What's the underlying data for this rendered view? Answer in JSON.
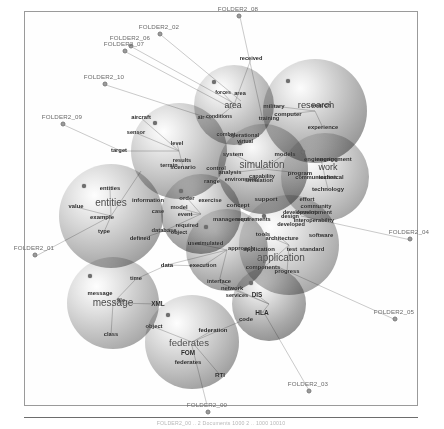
{
  "figure": {
    "caption": "FOLDER2_00  .. 2   Documents   1000 2   ..  1000    10010",
    "frame_color": "#9a9a9a",
    "background": "#ffffff"
  },
  "chart_data": {
    "type": "scatter",
    "xlabel": "",
    "ylabel": "",
    "legend": "none",
    "grid": false,
    "clusters": [
      {
        "id": "research",
        "label": "research",
        "cx": 314,
        "cy": 110,
        "r": 52,
        "shade": "gB"
      },
      {
        "id": "area",
        "label": "area",
        "cx": 233,
        "cy": 104,
        "r": 40,
        "shade": "gA"
      },
      {
        "id": "simulation",
        "label": "simulation",
        "cx": 262,
        "cy": 168,
        "r": 45,
        "shade": "gD"
      },
      {
        "id": "work",
        "label": "work",
        "cx": 324,
        "cy": 176,
        "r": 44,
        "shade": "gC"
      },
      {
        "id": "scenario",
        "label": "scenario",
        "cx": 178,
        "cy": 150,
        "r": 48,
        "shade": "gA"
      },
      {
        "id": "order",
        "label": "order",
        "cx": 200,
        "cy": 213,
        "r": 40,
        "shade": "gD"
      },
      {
        "id": "application",
        "label": "application",
        "cx": 288,
        "cy": 244,
        "r": 50,
        "shade": "gC"
      },
      {
        "id": "entities",
        "label": "entities",
        "cx": 110,
        "cy": 215,
        "r": 52,
        "shade": "gA"
      },
      {
        "id": "user",
        "label": "user",
        "cx": 226,
        "cy": 249,
        "r": 41,
        "shade": "gB"
      },
      {
        "id": "message",
        "label": "message",
        "cx": 112,
        "cy": 302,
        "r": 46,
        "shade": "gC"
      },
      {
        "id": "federates",
        "label": "federates",
        "cx": 191,
        "cy": 341,
        "r": 47,
        "shade": "gA"
      },
      {
        "id": "hla",
        "label": "HLA",
        "cx": 268,
        "cy": 303,
        "r": 37,
        "shade": "gD"
      }
    ],
    "terms": [
      {
        "text": "received",
        "x": 250,
        "y": 58,
        "size": 5.6
      },
      {
        "text": "forces",
        "x": 222,
        "y": 92,
        "size": 5.2
      },
      {
        "text": "area",
        "x": 239,
        "y": 93,
        "size": 5.6
      },
      {
        "text": "area",
        "x": 232,
        "y": 104,
        "size": 8.6,
        "style": "big"
      },
      {
        "text": "military",
        "x": 273,
        "y": 105,
        "size": 6.0
      },
      {
        "text": "research",
        "x": 315,
        "y": 104,
        "size": 9.4,
        "style": "big"
      },
      {
        "text": "search",
        "x": 320,
        "y": 104,
        "size": 6.2
      },
      {
        "text": "computer",
        "x": 287,
        "y": 113,
        "size": 6.0
      },
      {
        "text": "conditions",
        "x": 218,
        "y": 116,
        "size": 5.2
      },
      {
        "text": "training",
        "x": 268,
        "y": 118,
        "size": 5.6
      },
      {
        "text": "air",
        "x": 200,
        "y": 117,
        "size": 5.6
      },
      {
        "text": "aircraft",
        "x": 140,
        "y": 117,
        "size": 5.8
      },
      {
        "text": "experience",
        "x": 322,
        "y": 127,
        "size": 5.8
      },
      {
        "text": "combat",
        "x": 225,
        "y": 134,
        "size": 5.4
      },
      {
        "text": "operational",
        "x": 243,
        "y": 135,
        "size": 5.6
      },
      {
        "text": "sensor",
        "x": 135,
        "y": 132,
        "size": 5.6
      },
      {
        "text": "virtual",
        "x": 244,
        "y": 141,
        "size": 5.4
      },
      {
        "text": "level",
        "x": 176,
        "y": 143,
        "size": 5.6
      },
      {
        "text": "target",
        "x": 118,
        "y": 150,
        "size": 5.8
      },
      {
        "text": "system",
        "x": 232,
        "y": 153,
        "size": 6.0
      },
      {
        "text": "models",
        "x": 284,
        "y": 153,
        "size": 6.0
      },
      {
        "text": "engineering",
        "x": 320,
        "y": 158,
        "size": 6.0
      },
      {
        "text": "engagement",
        "x": 333,
        "y": 158,
        "size": 6.0
      },
      {
        "text": "results",
        "x": 181,
        "y": 160,
        "size": 5.6
      },
      {
        "text": "terrain",
        "x": 168,
        "y": 165,
        "size": 5.6
      },
      {
        "text": "scenario",
        "x": 182,
        "y": 166,
        "size": 6.2
      },
      {
        "text": "simulation",
        "x": 261,
        "y": 164,
        "size": 10.0,
        "style": "huge"
      },
      {
        "text": "work",
        "x": 327,
        "y": 166,
        "size": 9.0,
        "style": "big"
      },
      {
        "text": "control",
        "x": 215,
        "y": 168,
        "size": 5.8
      },
      {
        "text": "analysis",
        "x": 229,
        "y": 172,
        "size": 5.8
      },
      {
        "text": "program",
        "x": 299,
        "y": 172,
        "size": 6.0
      },
      {
        "text": "capability",
        "x": 261,
        "y": 176,
        "size": 5.6
      },
      {
        "text": "environment",
        "x": 240,
        "y": 179,
        "size": 5.4
      },
      {
        "text": "simulation",
        "x": 258,
        "y": 180,
        "size": 5.6
      },
      {
        "text": "communication",
        "x": 315,
        "y": 177,
        "size": 5.6
      },
      {
        "text": "technical",
        "x": 330,
        "y": 177,
        "size": 5.8
      },
      {
        "text": "range",
        "x": 211,
        "y": 181,
        "size": 5.8
      },
      {
        "text": "technology",
        "x": 327,
        "y": 188,
        "size": 6.0
      },
      {
        "text": "entities",
        "x": 109,
        "y": 188,
        "size": 5.8
      },
      {
        "text": "information",
        "x": 147,
        "y": 200,
        "size": 5.8
      },
      {
        "text": "order",
        "x": 186,
        "y": 197,
        "size": 6.0
      },
      {
        "text": "exercise",
        "x": 209,
        "y": 200,
        "size": 5.8
      },
      {
        "text": "entities",
        "x": 110,
        "y": 202,
        "size": 10.0,
        "style": "huge"
      },
      {
        "text": "support",
        "x": 265,
        "y": 198,
        "size": 6.2
      },
      {
        "text": "effort",
        "x": 306,
        "y": 199,
        "size": 5.8
      },
      {
        "text": "value",
        "x": 75,
        "y": 206,
        "size": 5.8
      },
      {
        "text": "model",
        "x": 178,
        "y": 207,
        "size": 5.8
      },
      {
        "text": "concept",
        "x": 237,
        "y": 204,
        "size": 6.0
      },
      {
        "text": "community",
        "x": 315,
        "y": 206,
        "size": 5.8
      },
      {
        "text": "case",
        "x": 157,
        "y": 211,
        "size": 5.6
      },
      {
        "text": "event",
        "x": 184,
        "y": 214,
        "size": 5.6
      },
      {
        "text": "example",
        "x": 101,
        "y": 216,
        "size": 6.0
      },
      {
        "text": "development",
        "x": 313,
        "y": 212,
        "size": 5.8
      },
      {
        "text": "developments",
        "x": 300,
        "y": 212,
        "size": 5.4
      },
      {
        "text": "design",
        "x": 289,
        "y": 216,
        "size": 5.6
      },
      {
        "text": "management",
        "x": 230,
        "y": 219,
        "size": 5.8
      },
      {
        "text": "requirements",
        "x": 252,
        "y": 219,
        "size": 5.6
      },
      {
        "text": "interoperability",
        "x": 313,
        "y": 220,
        "size": 5.6
      },
      {
        "text": "required",
        "x": 186,
        "y": 225,
        "size": 5.8
      },
      {
        "text": "developed",
        "x": 290,
        "y": 224,
        "size": 5.6
      },
      {
        "text": "type",
        "x": 103,
        "y": 231,
        "size": 5.8
      },
      {
        "text": "database",
        "x": 163,
        "y": 230,
        "size": 5.8
      },
      {
        "text": "object",
        "x": 178,
        "y": 232,
        "size": 5.6
      },
      {
        "text": "tools",
        "x": 262,
        "y": 233,
        "size": 6.0
      },
      {
        "text": "architecture",
        "x": 281,
        "y": 238,
        "size": 5.8
      },
      {
        "text": "software",
        "x": 320,
        "y": 234,
        "size": 6.0
      },
      {
        "text": "defined",
        "x": 139,
        "y": 238,
        "size": 5.8
      },
      {
        "text": "user",
        "x": 193,
        "y": 242,
        "size": 6.0
      },
      {
        "text": "simulated",
        "x": 209,
        "y": 243,
        "size": 5.6
      },
      {
        "text": "approach",
        "x": 240,
        "y": 248,
        "size": 5.8
      },
      {
        "text": "application",
        "x": 258,
        "y": 248,
        "size": 6.0
      },
      {
        "text": "test",
        "x": 291,
        "y": 249,
        "size": 5.8
      },
      {
        "text": "standard",
        "x": 311,
        "y": 249,
        "size": 5.8
      },
      {
        "text": "application",
        "x": 280,
        "y": 257,
        "size": 10.0,
        "style": "huge"
      },
      {
        "text": "data",
        "x": 166,
        "y": 264,
        "size": 6.0
      },
      {
        "text": "execution",
        "x": 202,
        "y": 265,
        "size": 5.8
      },
      {
        "text": "components",
        "x": 262,
        "y": 267,
        "size": 5.8
      },
      {
        "text": "progress",
        "x": 286,
        "y": 271,
        "size": 5.8
      },
      {
        "text": "time",
        "x": 135,
        "y": 278,
        "size": 5.8
      },
      {
        "text": "interface",
        "x": 218,
        "y": 281,
        "size": 5.8
      },
      {
        "text": "message",
        "x": 99,
        "y": 293,
        "size": 5.8
      },
      {
        "text": "network",
        "x": 231,
        "y": 288,
        "size": 5.8
      },
      {
        "text": "services",
        "x": 236,
        "y": 295,
        "size": 5.6
      },
      {
        "text": "DIS",
        "x": 256,
        "y": 294,
        "size": 6.4
      },
      {
        "text": "file",
        "x": 120,
        "y": 300,
        "size": 5.6
      },
      {
        "text": "message",
        "x": 112,
        "y": 302,
        "size": 10.0,
        "style": "huge"
      },
      {
        "text": "XML",
        "x": 157,
        "y": 303,
        "size": 6.4
      },
      {
        "text": "HLA",
        "x": 261,
        "y": 312,
        "size": 6.6
      },
      {
        "text": "code",
        "x": 245,
        "y": 318,
        "size": 6.0
      },
      {
        "text": "object",
        "x": 153,
        "y": 326,
        "size": 5.8
      },
      {
        "text": "class",
        "x": 110,
        "y": 334,
        "size": 5.8
      },
      {
        "text": "federation",
        "x": 212,
        "y": 329,
        "size": 6.0
      },
      {
        "text": "federates",
        "x": 188,
        "y": 342,
        "size": 9.6,
        "style": "huge"
      },
      {
        "text": "FOM",
        "x": 187,
        "y": 352,
        "size": 6.4
      },
      {
        "text": "federates",
        "x": 187,
        "y": 361,
        "size": 6.0
      },
      {
        "text": "RTI",
        "x": 219,
        "y": 374,
        "size": 6.2
      }
    ],
    "folder_nodes": [
      {
        "label": "FOLDER2_08",
        "lx": 238,
        "ly": 8,
        "dx": 239,
        "dy": 16
      },
      {
        "label": "FOLDER2_02",
        "lx": 159,
        "ly": 26,
        "dx": 160,
        "dy": 34
      },
      {
        "label": "FOLDER2_06",
        "lx": 130,
        "ly": 37,
        "dx": 131,
        "dy": 46
      },
      {
        "label": "FOLDER2_07",
        "lx": 124,
        "ly": 43,
        "dx": 125,
        "dy": 51
      },
      {
        "label": "FOLDER2_10",
        "lx": 104,
        "ly": 76,
        "dx": 105,
        "dy": 84
      },
      {
        "label": "FOLDER2_09",
        "lx": 62,
        "ly": 116,
        "dx": 63,
        "dy": 124
      },
      {
        "label": "FOLDER2_01",
        "lx": 34,
        "ly": 247,
        "dx": 35,
        "dy": 255
      },
      {
        "label": "FOLDER2_04",
        "lx": 409,
        "ly": 231,
        "dx": 410,
        "dy": 239
      },
      {
        "label": "FOLDER2_05",
        "lx": 394,
        "ly": 311,
        "dx": 395,
        "dy": 319
      },
      {
        "label": "FOLDER2_03",
        "lx": 308,
        "ly": 383,
        "dx": 309,
        "dy": 391
      },
      {
        "label": "FOLDER2_00",
        "lx": 207,
        "ly": 404,
        "dx": 208,
        "dy": 412
      }
    ],
    "edges": [
      [
        239,
        16,
        262,
        120
      ],
      [
        160,
        34,
        240,
        100
      ],
      [
        131,
        46,
        236,
        104
      ],
      [
        125,
        51,
        232,
        108
      ],
      [
        105,
        84,
        210,
        118
      ],
      [
        63,
        124,
        120,
        150
      ],
      [
        35,
        255,
        110,
        215
      ],
      [
        410,
        239,
        300,
        215
      ],
      [
        395,
        319,
        275,
        265
      ],
      [
        309,
        391,
        262,
        310
      ],
      [
        208,
        412,
        191,
        345
      ],
      [
        110,
        215,
        140,
        170
      ],
      [
        110,
        215,
        101,
        216
      ],
      [
        110,
        215,
        75,
        206
      ],
      [
        110,
        215,
        103,
        231
      ],
      [
        110,
        215,
        109,
        188
      ],
      [
        178,
        150,
        140,
        117
      ],
      [
        178,
        150,
        135,
        132
      ],
      [
        178,
        150,
        176,
        143
      ],
      [
        178,
        150,
        118,
        150
      ],
      [
        178,
        150,
        182,
        166
      ],
      [
        262,
        168,
        232,
        153
      ],
      [
        262,
        168,
        284,
        153
      ],
      [
        262,
        168,
        229,
        172
      ],
      [
        262,
        168,
        299,
        172
      ],
      [
        314,
        110,
        273,
        105
      ],
      [
        314,
        110,
        287,
        113
      ],
      [
        314,
        110,
        322,
        127
      ],
      [
        233,
        104,
        222,
        92
      ],
      [
        233,
        104,
        250,
        58
      ],
      [
        233,
        104,
        218,
        116
      ],
      [
        324,
        176,
        320,
        158
      ],
      [
        324,
        176,
        327,
        188
      ],
      [
        324,
        176,
        315,
        177
      ],
      [
        200,
        213,
        186,
        197
      ],
      [
        200,
        213,
        178,
        207
      ],
      [
        200,
        213,
        184,
        214
      ],
      [
        200,
        213,
        163,
        230
      ],
      [
        226,
        249,
        193,
        242
      ],
      [
        226,
        249,
        202,
        265
      ],
      [
        226,
        249,
        166,
        264
      ],
      [
        226,
        249,
        218,
        281
      ],
      [
        288,
        244,
        262,
        233
      ],
      [
        288,
        244,
        281,
        238
      ],
      [
        288,
        244,
        262,
        267
      ],
      [
        288,
        244,
        286,
        271
      ],
      [
        112,
        302,
        120,
        300
      ],
      [
        112,
        302,
        110,
        334
      ],
      [
        112,
        302,
        157,
        303
      ],
      [
        112,
        302,
        135,
        278
      ],
      [
        191,
        341,
        212,
        329
      ],
      [
        191,
        341,
        153,
        326
      ],
      [
        191,
        341,
        219,
        374
      ],
      [
        191,
        341,
        245,
        318
      ],
      [
        268,
        303,
        256,
        294
      ],
      [
        268,
        303,
        231,
        288
      ],
      [
        268,
        303,
        218,
        281
      ],
      [
        268,
        303,
        261,
        312
      ],
      [
        166,
        264,
        135,
        278
      ],
      [
        166,
        264,
        202,
        265
      ],
      [
        163,
        230,
        139,
        238
      ],
      [
        163,
        230,
        178,
        232
      ]
    ]
  }
}
